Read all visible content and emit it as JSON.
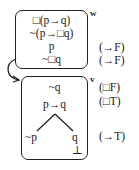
{
  "world_w": {
    "label": "w",
    "formulas": [
      "□(p→q)",
      "~(p→□q)",
      "p",
      "~□q"
    ],
    "annotations": [
      "",
      "",
      "(→F)",
      "(→F)"
    ]
  },
  "world_v": {
    "label": "v",
    "formulas": [
      "~q",
      "p→q"
    ],
    "annotations": [
      "(□F)",
      "(□T)"
    ],
    "branch_left": "~p",
    "branch_right": "q",
    "closed_marker": "⊥",
    "branch_annotation": "(→T)"
  },
  "accessibility_arrow": "w-to-v"
}
